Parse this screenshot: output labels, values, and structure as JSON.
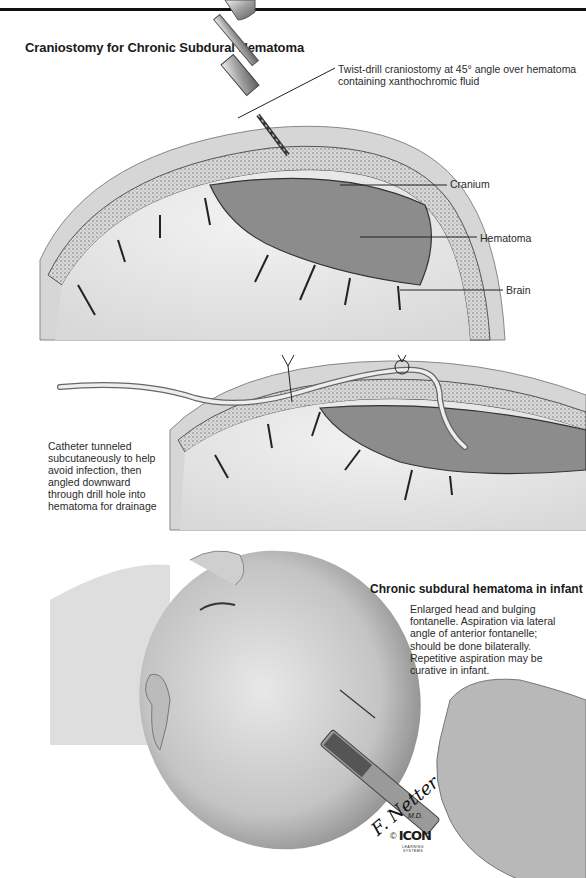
{
  "page": {
    "title": "Craniostomy for Chronic Subdural Hematoma"
  },
  "top_panel": {
    "labels": {
      "drill": "Twist-drill craniostomy at 45° angle over hematoma containing xanthochromic fluid",
      "cranium": "Cranium",
      "hematoma": "Hematoma",
      "brain": "Brain"
    }
  },
  "middle_panel": {
    "note": "Catheter tunneled subcutaneously to help avoid infection, then angled downward through drill hole into hematoma for drainage"
  },
  "bottom_panel": {
    "title": "Chronic subdural hematoma in infant",
    "note": "Enlarged head and bulging fontanelle. Aspiration via lateral angle of anterior fontanelle; should be done bilaterally. Repetitive aspiration may be curative in infant."
  },
  "credits": {
    "signature": "F. Netter",
    "signature_suffix": "M.D.",
    "copyright_symbol": "©",
    "publisher": "ICON",
    "publisher_sub": "LEARNING SYSTEMS"
  },
  "colors": {
    "ink": "#1a1a1a",
    "tissue_light": "#e6e6e6",
    "tissue_mid": "#bdbdbd",
    "hematoma": "#8c8c8c",
    "skull_dots": "#9a9a9a"
  }
}
